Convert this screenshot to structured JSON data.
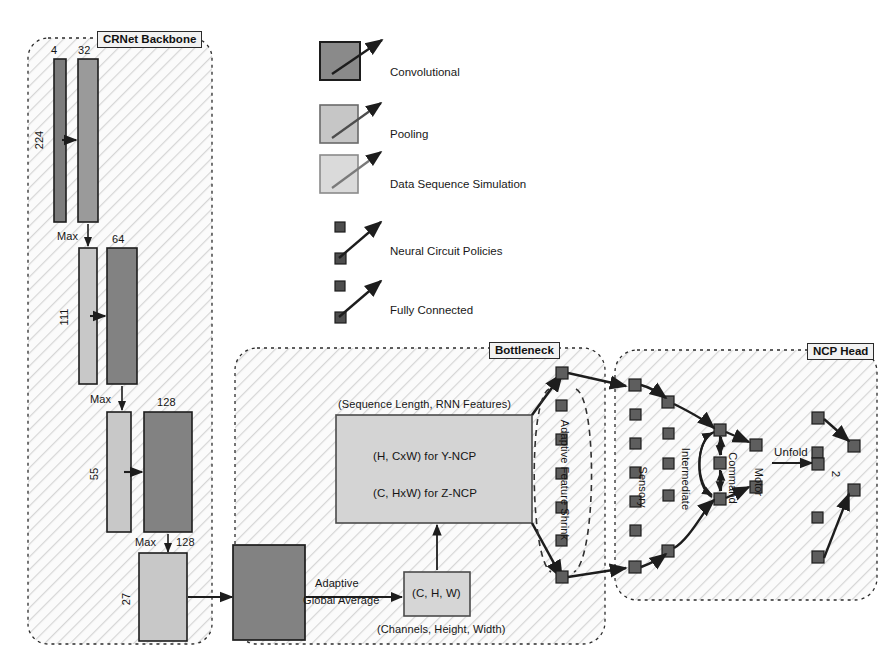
{
  "figure": {
    "groups": [
      {
        "id": "backbone",
        "label": "CRNet Backbone"
      },
      {
        "id": "bottleneck",
        "label": "Bottleneck"
      },
      {
        "id": "ncphead",
        "label": "NCP Head"
      }
    ]
  },
  "colors": {
    "conv": "#7d7d7d",
    "pool": "#c0c0c0",
    "sim": "#d9d9d9",
    "node": "#5e5e5e",
    "stroke": "#1d1d1d",
    "hatch": "#d2d2d2",
    "group_bg": "#fbfbfb",
    "title_bg": "#f2f2f2"
  },
  "legend": {
    "items": [
      {
        "id": "convolutional",
        "label": "Convolutional",
        "swatch": "conv",
        "kind": "box"
      },
      {
        "id": "pooling",
        "label": "Pooling",
        "swatch": "pool",
        "kind": "box"
      },
      {
        "id": "data-sequence-simulation",
        "label": "Data Sequence Simulation",
        "swatch": "sim",
        "kind": "box"
      },
      {
        "id": "neural-circuit-policies",
        "label": "Neural Circuit Policies",
        "swatch": "node",
        "kind": "nodes"
      },
      {
        "id": "fully-connected",
        "label": "Fully Connected",
        "swatch": "node",
        "kind": "nodes"
      }
    ]
  },
  "backbone": {
    "blocks": [
      {
        "id": "conv-4",
        "type": "conv",
        "channels": "4",
        "spatial": "224"
      },
      {
        "id": "conv-32",
        "type": "conv",
        "channels": "32",
        "spatial": ""
      },
      {
        "id": "pool-111",
        "type": "pool",
        "channels": "",
        "spatial": "111"
      },
      {
        "id": "conv-64",
        "type": "conv",
        "channels": "64",
        "spatial": ""
      },
      {
        "id": "pool-55",
        "type": "pool",
        "channels": "",
        "spatial": "55"
      },
      {
        "id": "conv-128",
        "type": "conv",
        "channels": "128",
        "spatial": ""
      },
      {
        "id": "pool-27",
        "type": "pool",
        "channels": "128",
        "spatial": "27"
      }
    ],
    "spatial_labels": {
      "s224": "224",
      "s111": "111",
      "s55": "55",
      "s27": "27"
    },
    "channel_labels": {
      "c4": "4",
      "c32": "32",
      "c64": "64",
      "c128a": "128",
      "c128b": "128"
    },
    "pool_ops": {
      "max1": "Max",
      "max2": "Max",
      "max3": "Max",
      "max4": "Max"
    }
  },
  "bottleneck": {
    "conv_block": {
      "id": "bottleneck-conv",
      "type": "conv"
    },
    "adaptive_pool_op": {
      "line1": "Adaptive",
      "line2": "Global Average"
    },
    "chw_box": {
      "label": "(C, H, W)",
      "caption": "(Channels, Height, Width)"
    },
    "sequence_box": {
      "caption": "(Sequence Length, RNN Features)",
      "line1": "(H, CxW) for Y-NCP",
      "line2": "(C, HxW) for Z-NCP"
    },
    "shrink_label": "Adaptive Feature Shrink",
    "shrink_node_count": 7
  },
  "ncp_head": {
    "layer_labels": {
      "sensory": "Sensory",
      "intermediate": "Intermediate",
      "command": "Command",
      "motor": "Motor"
    },
    "unfold_label": "Unfold",
    "output_label": "2",
    "counts": {
      "sensory": 7,
      "intermediate": 5,
      "command": 3,
      "motor": 2,
      "unfold_in": 5,
      "unfold_out": 2
    }
  }
}
